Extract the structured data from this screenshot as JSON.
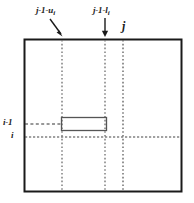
{
  "figure": {
    "name": "index-interval-diagram",
    "background_color": "#ffffff",
    "line_color": "#4d4d4d",
    "border_color": "#1a1a1a",
    "text_color": "#1a1a1a"
  },
  "labels": {
    "top_left": {
      "base": "j-1-u",
      "subscript": "i"
    },
    "top_middle": {
      "base": "j-1-l",
      "subscript": "i"
    },
    "top_right": {
      "base": "j",
      "subscript": ""
    },
    "left_upper": {
      "base": "i-1",
      "subscript": ""
    },
    "left_lower": {
      "base": "i",
      "subscript": ""
    }
  },
  "geometry": {
    "outer_box": {
      "x": 24,
      "y": 39,
      "width": 158,
      "height": 153
    },
    "vertical_lines": [
      {
        "name": "line-j-1-minus-u-i",
        "x": 62,
        "style": "dotted"
      },
      {
        "name": "line-j-1-minus-l-i",
        "x": 105,
        "style": "dotted"
      },
      {
        "name": "line-j",
        "x": 123,
        "style": "dotted"
      }
    ],
    "horizontal_lines": [
      {
        "name": "line-i-minus-1",
        "y": 124,
        "style": "dashed",
        "x_start": 24,
        "x_end": 62
      },
      {
        "name": "line-i",
        "y": 137,
        "style": "dotted",
        "x_start": 24,
        "x_end": 182
      }
    ],
    "inner_rect": {
      "x": 61,
      "y": 117,
      "width": 46,
      "height": 14
    },
    "arrows": [
      {
        "name": "arrow-to-j-1-minus-u-i",
        "x1": 50,
        "y1": 19,
        "x2": 62,
        "y2": 36
      },
      {
        "name": "arrow-to-j-1-minus-l-i",
        "x1": 105,
        "y1": 18,
        "x2": 105,
        "y2": 36
      }
    ]
  }
}
